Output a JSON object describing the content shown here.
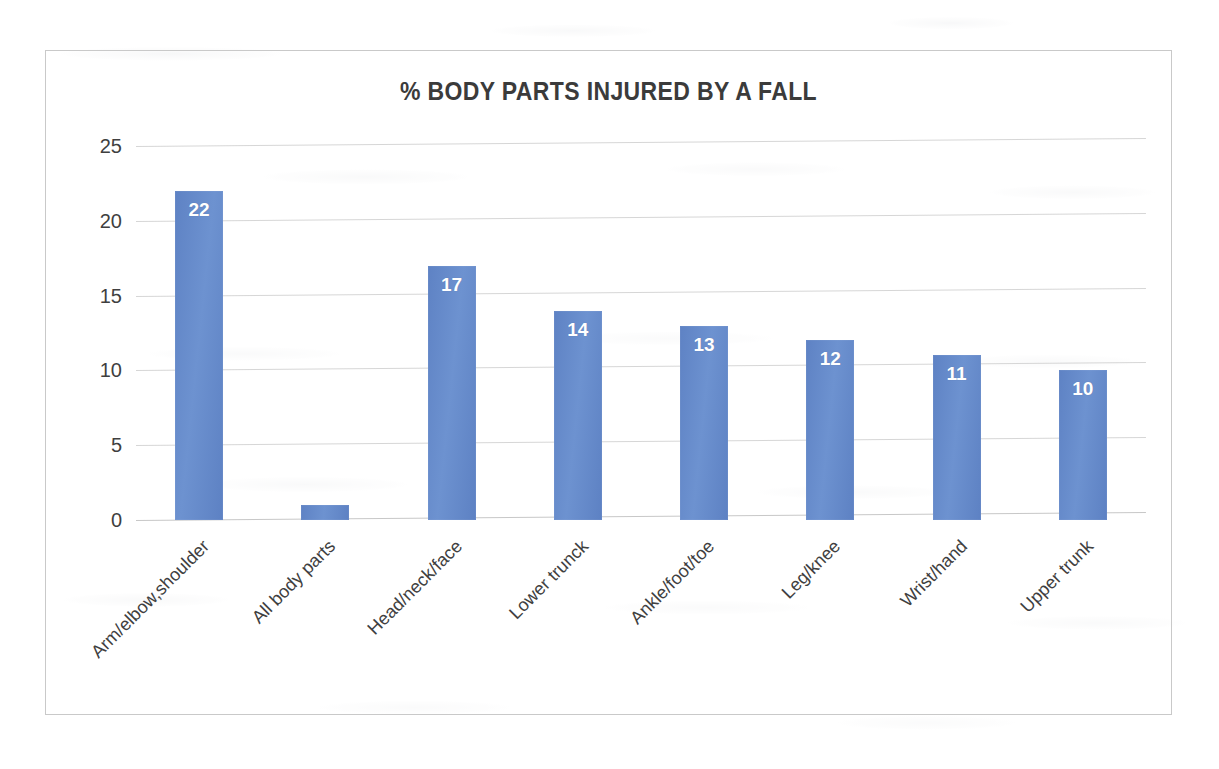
{
  "document": {
    "background_color": "#ffffff",
    "frame_border_color": "#c9c9c9"
  },
  "chart_data": {
    "type": "bar",
    "title": "% BODY PARTS INJURED BY A FALL",
    "xlabel": "",
    "ylabel": "",
    "ylim": [
      0,
      25
    ],
    "yticks": [
      0,
      5,
      10,
      15,
      20,
      25
    ],
    "grid": true,
    "legend": false,
    "bar_color": "#6286c8",
    "value_label_color": "#ffffff",
    "categories": [
      "Arm/elbow,shoulder",
      "All body parts",
      "Head/neck/face",
      "Lower trunck",
      "Ankle/foot/toe",
      "Leg/knee",
      "Wrist/hand",
      "Upper trunk"
    ],
    "values": [
      22,
      1,
      17,
      14,
      13,
      12,
      11,
      10
    ],
    "value_labels": [
      "22",
      "",
      "17",
      "14",
      "13",
      "12",
      "11",
      "10"
    ]
  }
}
